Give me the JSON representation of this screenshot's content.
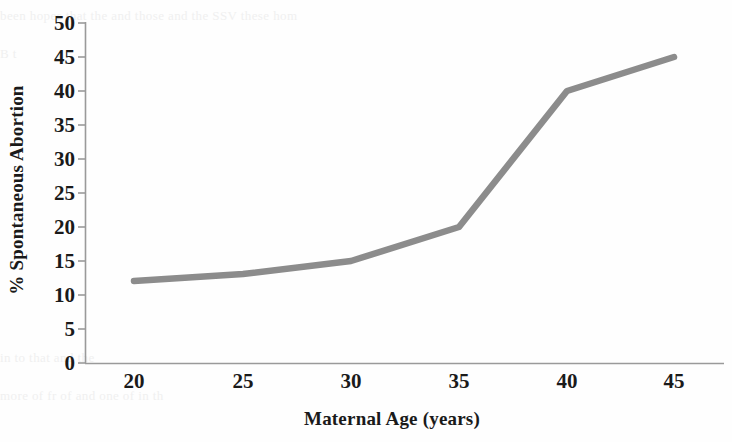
{
  "chart_data": {
    "type": "line",
    "title": "",
    "subtitle": "",
    "xlabel": "Maternal Age (years)",
    "ylabel": "% Spontaneous Abortion",
    "x": [
      20,
      25,
      30,
      35,
      40,
      45
    ],
    "values": [
      12,
      13,
      15,
      20,
      40,
      45
    ],
    "series": [
      {
        "name": "% Spontaneous Abortion",
        "x": [
          20,
          25,
          30,
          35,
          40,
          45
        ],
        "values": [
          12,
          13,
          15,
          20,
          40,
          45
        ],
        "color": "#8c8c8c",
        "line_width": 6,
        "markers": "none"
      }
    ],
    "xlim": [
      18.75,
      46.25
    ],
    "ylim": [
      0,
      50
    ],
    "xticks": [
      20,
      25,
      30,
      35,
      40,
      45
    ],
    "yticks": [
      0,
      5,
      10,
      15,
      20,
      25,
      30,
      35,
      40,
      45,
      50
    ],
    "xtick_labels": [
      "20",
      "25",
      "30",
      "35",
      "40",
      "45"
    ],
    "ytick_labels": [
      "0",
      "5",
      "10",
      "15",
      "20",
      "25",
      "30",
      "35",
      "40",
      "45",
      "50"
    ],
    "grid": false,
    "legend": false,
    "legend_position": "none",
    "annotations": [],
    "axis_color": "#9a9a9a",
    "tick_direction": "out",
    "spines": {
      "left": true,
      "bottom": true,
      "top": false,
      "right": false
    }
  },
  "background": {
    "page_color": "#fefefe",
    "bleed_through_text": [
      "been hopes that the   and those   and the SSV  these   hom",
      "B                                                    t",
      "",
      "",
      "",
      "",
      "",
      "",
      "",
      "in                       to                   that           and          the",
      "more  of       fr    of         and          one      of         in               th"
    ]
  }
}
